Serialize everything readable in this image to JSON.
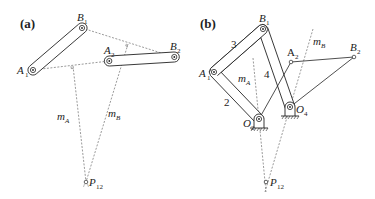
{
  "panels": [
    {
      "id": "a",
      "label": "(a)",
      "points": {
        "A1": {
          "label": "A",
          "sub": "1"
        },
        "B1": {
          "label": "B",
          "sub": "1"
        },
        "A2": {
          "label": "A",
          "sub": "2"
        },
        "B2": {
          "label": "B",
          "sub": "2"
        },
        "P12": {
          "label": "P",
          "sub": "12"
        }
      },
      "lines": {
        "mA": {
          "label": "m",
          "sub": "A"
        },
        "mB": {
          "label": "m",
          "sub": "B"
        }
      }
    },
    {
      "id": "b",
      "label": "(b)",
      "points": {
        "A1": {
          "label": "A",
          "sub": "1"
        },
        "B1": {
          "label": "B",
          "sub": "1"
        },
        "A2": {
          "label": "A",
          "sub": "2"
        },
        "B2": {
          "label": "B",
          "sub": "2"
        },
        "O2": {
          "label": "O",
          "sub": "2"
        },
        "O4": {
          "label": "O",
          "sub": "4"
        },
        "P12": {
          "label": "P",
          "sub": "12"
        }
      },
      "links": {
        "link2": "2",
        "link3": "3",
        "link4": "4"
      },
      "lines": {
        "mA": {
          "label": "m",
          "sub": "A"
        },
        "mB": {
          "label": "m",
          "sub": "B"
        }
      }
    }
  ],
  "colors": {
    "stroke": "#222222",
    "dashed": "#555555",
    "background": "#ffffff"
  }
}
